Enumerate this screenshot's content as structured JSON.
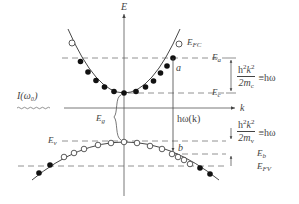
{
  "diagram": {
    "type": "semiconductor band structure (E vs k) with optical transition",
    "axes": {
      "vertical": "E",
      "horizontal": "k"
    },
    "incident_light": "I(ω₀)",
    "labels": {
      "E_FC": "E",
      "E_FC_sub": "FC",
      "E_a": "E",
      "E_a_sub": "a",
      "E_c": "E",
      "E_c_sub": "c",
      "E_v": "E",
      "E_v_sub": "v",
      "E_b": "E",
      "E_b_sub": "b",
      "E_FV": "E",
      "E_FV_sub": "FV",
      "E_g": "E",
      "E_g_sub": "g",
      "point_a": "a",
      "point_b": "b",
      "transition": "hω(k)"
    },
    "formula_conduction": {
      "numerator": "h",
      "num_sup": "2",
      "num_k": "k",
      "num_k_sup": "2",
      "denominator": "2m",
      "den_sub": "c",
      "rhs": "≡hω"
    },
    "formula_valence": {
      "numerator": "h",
      "num_sup": "2",
      "num_k": "k",
      "num_k_sup": "2",
      "denominator": "2m",
      "den_sub": "v",
      "rhs": "≡hω"
    },
    "legend_meaning": {
      "filled_circle": "occupied electron state",
      "open_circle": "empty state (hole)"
    },
    "colors": {
      "line": "#444444",
      "dash": "#666666",
      "dot_fill": "#111111",
      "open_dot_fill": "#ffffff"
    }
  }
}
